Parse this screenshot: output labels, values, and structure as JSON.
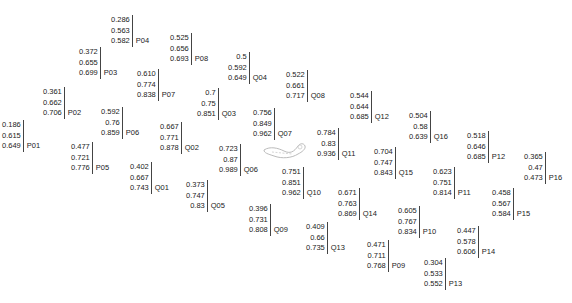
{
  "nodes": [
    {
      "id": "P01",
      "x": 2,
      "y": 120,
      "values": [
        "0.186",
        "0.615",
        "0.649"
      ]
    },
    {
      "id": "P02",
      "x": 43,
      "y": 87,
      "values": [
        "0.361",
        "0.662",
        "0.706"
      ]
    },
    {
      "id": "P03",
      "x": 79,
      "y": 47,
      "values": [
        "0.372",
        "0.655",
        "0.699"
      ]
    },
    {
      "id": "P04",
      "x": 111,
      "y": 15,
      "values": [
        "0.286",
        "0.563",
        "0.582"
      ]
    },
    {
      "id": "P05",
      "x": 71,
      "y": 142,
      "values": [
        "0.477",
        "0.721",
        "0.776"
      ]
    },
    {
      "id": "P06",
      "x": 101,
      "y": 107,
      "values": [
        "0.592",
        "0.76",
        "0.859"
      ]
    },
    {
      "id": "P07",
      "x": 137,
      "y": 69,
      "values": [
        "0.610",
        "0.774",
        "0.838"
      ]
    },
    {
      "id": "P08",
      "x": 170,
      "y": 33,
      "values": [
        "0.525",
        "0.656",
        "0.693"
      ]
    },
    {
      "id": "P09",
      "x": 367,
      "y": 240,
      "values": [
        "0.471",
        "0.711",
        "0.768"
      ]
    },
    {
      "id": "P10",
      "x": 398,
      "y": 206,
      "values": [
        "0.605",
        "0.767",
        "0.834"
      ]
    },
    {
      "id": "P11",
      "x": 433,
      "y": 167,
      "values": [
        "0.623",
        "0.751",
        "0.814"
      ]
    },
    {
      "id": "P12",
      "x": 467,
      "y": 131,
      "values": [
        "0.518",
        "0.646",
        "0.685"
      ]
    },
    {
      "id": "P13",
      "x": 424,
      "y": 258,
      "values": [
        "0.304",
        "0.533",
        "0.552"
      ]
    },
    {
      "id": "P14",
      "x": 457,
      "y": 226,
      "values": [
        "0.447",
        "0.578",
        "0.606"
      ]
    },
    {
      "id": "P15",
      "x": 492,
      "y": 188,
      "values": [
        "0.458",
        "0.567",
        "0.584"
      ]
    },
    {
      "id": "P16",
      "x": 524,
      "y": 152,
      "values": [
        "0.365",
        "0.47",
        "0.473"
      ]
    },
    {
      "id": "Q01",
      "x": 130,
      "y": 162,
      "values": [
        "0.402",
        "0.667",
        "0.743"
      ]
    },
    {
      "id": "Q02",
      "x": 160,
      "y": 122,
      "values": [
        "0.667",
        "0.771",
        "0.878"
      ]
    },
    {
      "id": "Q03",
      "x": 197,
      "y": 88,
      "values": [
        "0.7",
        "0.75",
        "0.851"
      ]
    },
    {
      "id": "Q04",
      "x": 228,
      "y": 52,
      "values": [
        "0.5",
        "0.592",
        "0.649"
      ]
    },
    {
      "id": "Q05",
      "x": 186,
      "y": 180,
      "values": [
        "0.373",
        "0.747",
        "0.83"
      ]
    },
    {
      "id": "Q06",
      "x": 219,
      "y": 144,
      "values": [
        "0.723",
        "0.87",
        "0.989"
      ]
    },
    {
      "id": "Q07",
      "x": 253,
      "y": 108,
      "values": [
        "0.756",
        "0.849",
        "0.962"
      ]
    },
    {
      "id": "Q08",
      "x": 286,
      "y": 70,
      "values": [
        "0.522",
        "0.661",
        "0.717"
      ]
    },
    {
      "id": "Q09",
      "x": 249,
      "y": 204,
      "values": [
        "0.396",
        "0.731",
        "0.808"
      ]
    },
    {
      "id": "Q10",
      "x": 282,
      "y": 167,
      "values": [
        "0.751",
        "0.851",
        "0.962"
      ]
    },
    {
      "id": "Q11",
      "x": 317,
      "y": 128,
      "values": [
        "0.784",
        "0.83",
        "0.936"
      ]
    },
    {
      "id": "Q12",
      "x": 350,
      "y": 91,
      "values": [
        "0.544",
        "0.644",
        "0.685"
      ]
    },
    {
      "id": "Q13",
      "x": 306,
      "y": 222,
      "values": [
        "0.409",
        "0.66",
        "0.735"
      ]
    },
    {
      "id": "Q14",
      "x": 338,
      "y": 188,
      "values": [
        "0.671",
        "0.763",
        "0.869"
      ]
    },
    {
      "id": "Q15",
      "x": 374,
      "y": 147,
      "values": [
        "0.704",
        "0.747",
        "0.843"
      ]
    },
    {
      "id": "Q16",
      "x": 409,
      "y": 111,
      "values": [
        "0.504",
        "0.58",
        "0.639"
      ]
    }
  ]
}
